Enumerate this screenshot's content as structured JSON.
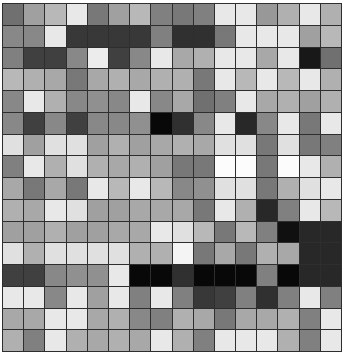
{
  "grid": {
    "rows": 16,
    "cols": 16,
    "line_color": "#2e2e2e",
    "cells": [
      [
        "#707070",
        "#a0a0a0",
        "#b8b8b8",
        "#e8e8e8",
        "#787878",
        "#a0a0a0",
        "#b8b8b8",
        "#808080",
        "#787878",
        "#808080",
        "#e8e8e8",
        "#e8e8e8",
        "#989898",
        "#b0b0b0",
        "#e8e8e8",
        "#b0b0b0"
      ],
      [
        "#888888",
        "#888888",
        "#e8e8e8",
        "#383838",
        "#383838",
        "#383838",
        "#383838",
        "#808080",
        "#303030",
        "#303030",
        "#787878",
        "#e8e8e8",
        "#e8e8e8",
        "#e8e8e8",
        "#a0a0a0",
        "#b8b8b8"
      ],
      [
        "#808080",
        "#404040",
        "#404040",
        "#888888",
        "#ececec",
        "#404040",
        "#888888",
        "#e8e8e8",
        "#a8a8a8",
        "#b0b0b0",
        "#e8e8e8",
        "#e8e8e8",
        "#a8a8a8",
        "#e8e8e8",
        "#181818",
        "#707070"
      ],
      [
        "#b8b8b8",
        "#b0b0b0",
        "#a8a8a8",
        "#787878",
        "#a8a8a8",
        "#b0b0b0",
        "#a8a8a8",
        "#b0b0b0",
        "#b0b0b0",
        "#787878",
        "#e8e8e8",
        "#b8b8b8",
        "#e8e8e8",
        "#b8b8b8",
        "#e8e8e8",
        "#b0b0b0"
      ],
      [
        "#888888",
        "#e8e8e8",
        "#b0b0b0",
        "#888888",
        "#909090",
        "#888888",
        "#e8e8e8",
        "#888888",
        "#a8a8a8",
        "#707070",
        "#808080",
        "#e8e8e8",
        "#a8a8a8",
        "#b0b0b0",
        "#a0a0a0",
        "#b0b0b0"
      ],
      [
        "#888888",
        "#404040",
        "#888888",
        "#404040",
        "#888888",
        "#888888",
        "#909090",
        "#080808",
        "#303030",
        "#888888",
        "#e8e8e8",
        "#282828",
        "#888888",
        "#e8e8e8",
        "#787878",
        "#e8e8e8"
      ],
      [
        "#e0e0e0",
        "#a0a0a0",
        "#e0e0e0",
        "#e0e0e0",
        "#a0a0a0",
        "#b0b0b0",
        "#a0a0a0",
        "#a8a8a8",
        "#b0b0b0",
        "#a8a8a8",
        "#e0e0e0",
        "#e0e0e0",
        "#787878",
        "#e0e0e0",
        "#787878",
        "#808080"
      ],
      [
        "#808080",
        "#e8e8e8",
        "#b0b0b0",
        "#e0e0e0",
        "#b0b0b0",
        "#a8a8a8",
        "#b0b0b0",
        "#a0a0a0",
        "#787878",
        "#787878",
        "#fcfcfc",
        "#fcfcfc",
        "#787878",
        "#fcfcfc",
        "#e8e8e8",
        "#b0b0b0"
      ],
      [
        "#a8a8a8",
        "#787878",
        "#a8a8a8",
        "#787878",
        "#e8e8e8",
        "#b8b8b8",
        "#e8e8e8",
        "#b8b8b8",
        "#888888",
        "#909090",
        "#e0e0e0",
        "#e0e0e0",
        "#787878",
        "#b0b0b0",
        "#e0e0e0",
        "#e8e8e8"
      ],
      [
        "#b0b0b0",
        "#a8a8a8",
        "#e8e8e8",
        "#e0e0e0",
        "#a0a0a0",
        "#a0a0a0",
        "#a8a8a8",
        "#a8a8a8",
        "#a8a8a8",
        "#787878",
        "#e8e8e8",
        "#b0b0b0",
        "#282828",
        "#808080",
        "#e8e8e8",
        "#b8b8b8"
      ],
      [
        "#a0a0a0",
        "#a0a0a0",
        "#b0b0b0",
        "#a0a0a0",
        "#a0a0a0",
        "#a8a8a8",
        "#a8a8a8",
        "#e8e8e8",
        "#e0e0e0",
        "#b8b8b8",
        "#787878",
        "#b8b8b8",
        "#808080",
        "#101010",
        "#282828",
        "#282828"
      ],
      [
        "#e0e0e0",
        "#b0b0b0",
        "#e0e0e0",
        "#e0e0e0",
        "#e0e0e0",
        "#e0e0e0",
        "#b0b0b0",
        "#b0b0b0",
        "#f4f4f4",
        "#787878",
        "#a8a8a8",
        "#787878",
        "#b0b0b0",
        "#a8a8a8",
        "#282828",
        "#282828"
      ],
      [
        "#404040",
        "#404040",
        "#888888",
        "#909090",
        "#909090",
        "#e8e8e8",
        "#080808",
        "#080808",
        "#303030",
        "#080808",
        "#080808",
        "#080808",
        "#808080",
        "#080808",
        "#282828",
        "#282828"
      ],
      [
        "#e8e8e8",
        "#e8e8e8",
        "#888888",
        "#e8e8e8",
        "#a0a0a0",
        "#e8e8e8",
        "#808080",
        "#e8e8e8",
        "#808080",
        "#383838",
        "#404040",
        "#808080",
        "#303030",
        "#808080",
        "#e8e8e8",
        "#808080"
      ],
      [
        "#a8a8a8",
        "#a8a8a8",
        "#e8e8e8",
        "#e8e8e8",
        "#a8a8a8",
        "#b0b0b0",
        "#888888",
        "#808080",
        "#b0b0b0",
        "#a8a8a8",
        "#787878",
        "#a8a8a8",
        "#a8a8a8",
        "#b0b0b0",
        "#808080",
        "#e8e8e8"
      ],
      [
        "#b0b0b0",
        "#808080",
        "#e8e8e8",
        "#b0b0b0",
        "#a8a8a8",
        "#b0b0b0",
        "#a8a8a8",
        "#e8e8e8",
        "#b0b0b0",
        "#808080",
        "#e8e8e8",
        "#e8e8e8",
        "#e8e8e8",
        "#b0b0b0",
        "#808080",
        "#e8e8e8"
      ]
    ]
  }
}
